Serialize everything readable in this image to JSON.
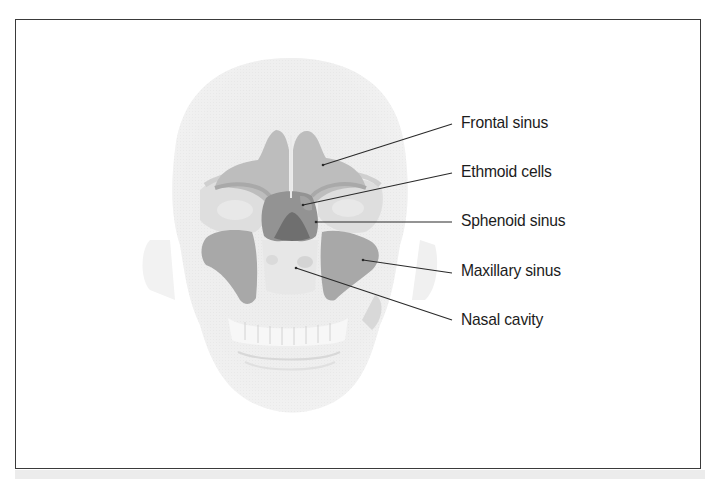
{
  "figure": {
    "colors": {
      "frame_border": "#3a3a3a",
      "skull_fill": "#ececec",
      "skull_shade": "#e0e0e0",
      "frontal_sinus": "#b9b9b9",
      "maxillary_sinus": "#a5a5a5",
      "ethmoid_cells": "#8f8f8f",
      "sphenoid_sinus": "#6e6e6e",
      "leader_line": "#2a2a2a",
      "label_text": "#1c1c1c"
    },
    "labels": [
      {
        "id": "frontal-sinus",
        "text": "Frontal sinus",
        "top": 114,
        "line": {
          "x1": 323,
          "y1": 165,
          "x2": 452,
          "y2": 124
        }
      },
      {
        "id": "ethmoid-cells",
        "text": "Ethmoid cells",
        "top": 162,
        "line": {
          "x1": 303,
          "y1": 205,
          "x2": 452,
          "y2": 173
        }
      },
      {
        "id": "sphenoid-sinus",
        "text": "Sphenoid sinus",
        "top": 211,
        "line": {
          "x1": 316,
          "y1": 222,
          "x2": 452,
          "y2": 222
        }
      },
      {
        "id": "maxillary-sinus",
        "text": "Maxillary sinus",
        "top": 261,
        "line": {
          "x1": 363,
          "y1": 260,
          "x2": 452,
          "y2": 273
        }
      },
      {
        "id": "nasal-cavity",
        "text": "Nasal cavity",
        "top": 310,
        "line": {
          "x1": 296,
          "y1": 268,
          "x2": 452,
          "y2": 320
        }
      }
    ]
  }
}
